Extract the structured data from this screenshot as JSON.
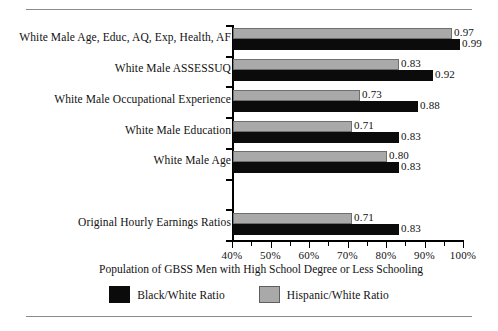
{
  "chart_data": {
    "type": "bar",
    "orientation": "horizontal",
    "title": "",
    "xlabel": "Population of GBSS Men with High School Degree or Less Schooling",
    "ylabel": "",
    "xlim": [
      40,
      100
    ],
    "xticks": [
      "40%",
      "50%",
      "60%",
      "70%",
      "80%",
      "90%",
      "100%"
    ],
    "xtick_values": [
      40,
      50,
      60,
      70,
      80,
      90,
      100
    ],
    "minor_tick_step": 5,
    "grid": false,
    "legend_position": "bottom-center",
    "value_format": "0.00",
    "categories": [
      "White Male Age, Educ, AQ, Exp, Health, AF",
      "White Male ASSESSUQ",
      "White Male Occupational Experience",
      "White Male Education",
      "White Male Age",
      "",
      "Original Hourly Earnings Ratios"
    ],
    "series": [
      {
        "name": "Hispanic/White Ratio",
        "color": "#a9a9a9",
        "values": [
          0.97,
          0.83,
          0.73,
          0.71,
          0.8,
          null,
          0.71
        ],
        "labels": [
          "0.97",
          "0.83",
          "0.73",
          "0.71",
          "0.80",
          "",
          "0.71"
        ]
      },
      {
        "name": "Black/White Ratio",
        "color": "#0b0b0b",
        "values": [
          0.99,
          0.92,
          0.88,
          0.83,
          0.83,
          null,
          0.83
        ],
        "labels": [
          "0.99",
          "0.92",
          "0.88",
          "0.83",
          "0.83",
          "",
          "0.83"
        ]
      }
    ]
  },
  "legend": {
    "items": [
      {
        "label": "Black/White Ratio",
        "swatch": "black"
      },
      {
        "label": "Hispanic/White Ratio",
        "swatch": "grey"
      }
    ]
  },
  "axis": {
    "x_title": "Population of GBSS Men with High School Degree or Less Schooling"
  }
}
